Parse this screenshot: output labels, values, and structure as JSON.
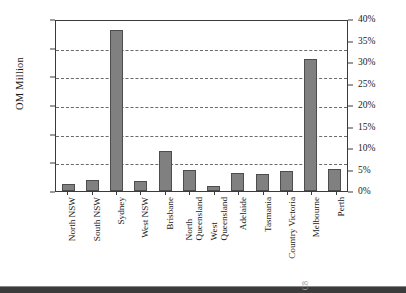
{
  "chart_data": {
    "type": "bar",
    "title": "",
    "xlabel": "",
    "ylabel": "OM Million",
    "ylim": [
      0,
      300
    ],
    "yticks": [
      0,
      50,
      100,
      150,
      200,
      250,
      300
    ],
    "ytick_labels": [
      "0",
      "50",
      "100",
      "150",
      "200",
      "250",
      "300"
    ],
    "secondary_axis": {
      "label": "",
      "ylim": [
        0,
        40
      ],
      "yticks": [
        0,
        5,
        10,
        15,
        20,
        25,
        30,
        35,
        40
      ],
      "ytick_labels": [
        "0%",
        "5%",
        "10%",
        "15%",
        "20%",
        "25%",
        "30%",
        "35%",
        "40%"
      ],
      "unit": "%"
    },
    "grid": true,
    "grid_style": "dashed-horizontal",
    "legend": null,
    "bar_color": "#808080",
    "bar_edge_color": "#4d4d4d",
    "axis_color": "#3a3a3a",
    "categories": [
      "North NSW",
      "South NSW",
      "Sydney",
      "West NSW",
      "Brisbane",
      "North Queensland",
      "West Queensland",
      "Adelaide",
      "Tasmania",
      "Country Victoria",
      "Melbourne",
      "Perth"
    ],
    "category_lines": [
      [
        "North NSW"
      ],
      [
        "South NSW"
      ],
      [
        "Sydney"
      ],
      [
        "West NSW"
      ],
      [
        "Brisbane"
      ],
      [
        "North",
        "Queensland"
      ],
      [
        "West",
        "Queensland"
      ],
      [
        "Adelaide"
      ],
      [
        "Tasmania"
      ],
      [
        "Country Victoria"
      ],
      [
        "Melbourne"
      ],
      [
        "Perth"
      ]
    ],
    "values": [
      12,
      20,
      280,
      17,
      69,
      36,
      8,
      31,
      29,
      35,
      230,
      38
    ]
  },
  "axes": {
    "left": {
      "title": "OM Million",
      "ticks": [
        "300",
        "250",
        "200",
        "150",
        "100",
        "50",
        "0"
      ]
    },
    "right": {
      "ticks": [
        "40%",
        "35%",
        "30%",
        "25%",
        "20%",
        "15%",
        "10%",
        "5%",
        "0%"
      ]
    }
  },
  "footer": {
    "page_marker": "C8"
  }
}
